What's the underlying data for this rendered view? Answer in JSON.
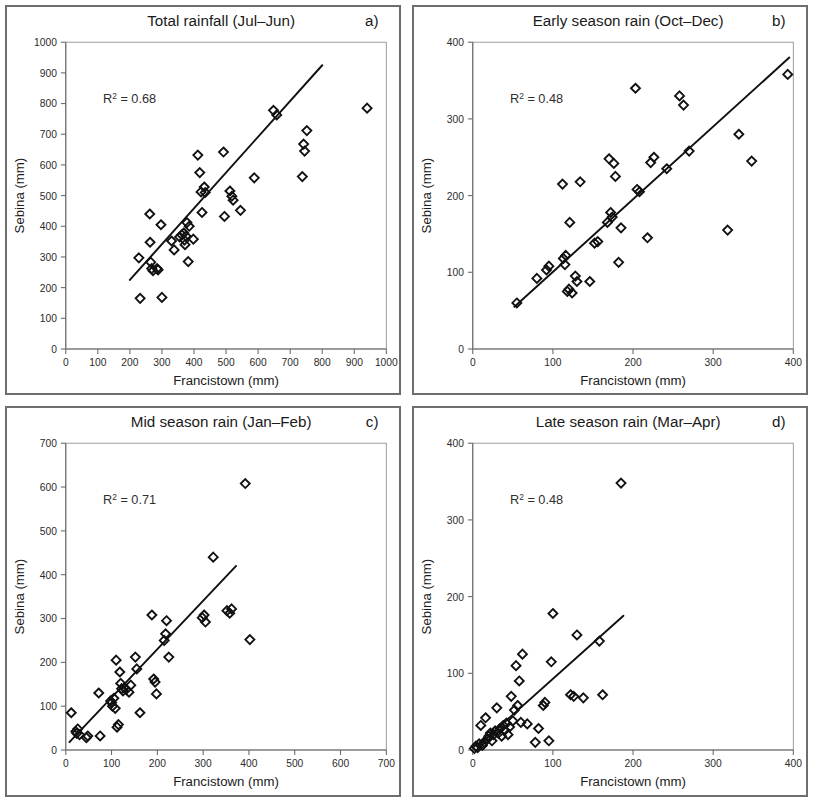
{
  "figure": {
    "axis_label_x": "Francistown (mm)",
    "axis_label_y": "Sebina (mm)",
    "marker_color": "#111111",
    "line_color": "#111111",
    "frame_color": "#6e6e6e"
  },
  "panels": [
    {
      "id": "panel-a",
      "letter": "a)",
      "title": "Total rainfall (Jul–Jun)",
      "r2_label": "R² = 0.68"
    },
    {
      "id": "panel-b",
      "letter": "b)",
      "title": "Early season rain (Oct–Dec)",
      "r2_label": "R² = 0.48"
    },
    {
      "id": "panel-c",
      "letter": "c)",
      "title": "Mid season rain (Jan–Feb)",
      "r2_label": "R² = 0.71"
    },
    {
      "id": "panel-d",
      "letter": "d)",
      "title": "Late season rain (Mar–Apr)",
      "r2_label": "R² = 0.48"
    }
  ],
  "chart_data": [
    {
      "type": "scatter",
      "panel": "a",
      "title": "Total rainfall (Jul–Jun)",
      "xlabel": "Francistown (mm)",
      "ylabel": "Sebina (mm)",
      "xlim": [
        0,
        1000
      ],
      "ylim": [
        0,
        1000
      ],
      "xticks": [
        0,
        100,
        200,
        300,
        400,
        500,
        600,
        700,
        800,
        900,
        1000
      ],
      "yticks": [
        0,
        100,
        200,
        300,
        400,
        500,
        600,
        700,
        800,
        900,
        1000
      ],
      "grid": false,
      "legend": "none",
      "annotation": "R² = 0.68",
      "r_squared": 0.68,
      "marker": "open-diamond",
      "trendline": {
        "x": [
          200,
          800
        ],
        "y": [
          225,
          925
        ]
      },
      "points": [
        [
          228,
          297
        ],
        [
          232,
          165
        ],
        [
          262,
          440
        ],
        [
          263,
          348
        ],
        [
          265,
          283
        ],
        [
          268,
          262
        ],
        [
          272,
          255
        ],
        [
          285,
          262
        ],
        [
          288,
          258
        ],
        [
          297,
          405
        ],
        [
          300,
          168
        ],
        [
          330,
          352
        ],
        [
          338,
          323
        ],
        [
          355,
          365
        ],
        [
          362,
          372
        ],
        [
          368,
          378
        ],
        [
          370,
          355
        ],
        [
          372,
          340
        ],
        [
          375,
          368
        ],
        [
          378,
          412
        ],
        [
          382,
          285
        ],
        [
          385,
          400
        ],
        [
          398,
          358
        ],
        [
          412,
          632
        ],
        [
          418,
          575
        ],
        [
          422,
          512
        ],
        [
          425,
          445
        ],
        [
          432,
          528
        ],
        [
          435,
          510
        ],
        [
          492,
          642
        ],
        [
          495,
          432
        ],
        [
          512,
          515
        ],
        [
          518,
          498
        ],
        [
          522,
          485
        ],
        [
          545,
          452
        ],
        [
          588,
          558
        ],
        [
          648,
          778
        ],
        [
          658,
          763
        ],
        [
          738,
          562
        ],
        [
          742,
          668
        ],
        [
          745,
          645
        ],
        [
          752,
          712
        ],
        [
          940,
          785
        ]
      ]
    },
    {
      "type": "scatter",
      "panel": "b",
      "title": "Early season rain (Oct–Dec)",
      "xlabel": "Francistown (mm)",
      "ylabel": "Sebina (mm)",
      "xlim": [
        0,
        400
      ],
      "ylim": [
        0,
        400
      ],
      "xticks": [
        0,
        100,
        200,
        300,
        400
      ],
      "yticks": [
        0,
        100,
        200,
        300,
        400
      ],
      "grid": false,
      "legend": "none",
      "annotation": "R² = 0.48",
      "r_squared": 0.48,
      "marker": "open-diamond",
      "trendline": {
        "x": [
          52,
          395
        ],
        "y": [
          55,
          380
        ]
      },
      "points": [
        [
          55,
          60
        ],
        [
          80,
          92
        ],
        [
          92,
          103
        ],
        [
          95,
          108
        ],
        [
          112,
          215
        ],
        [
          113,
          118
        ],
        [
          115,
          110
        ],
        [
          116,
          122
        ],
        [
          118,
          75
        ],
        [
          120,
          78
        ],
        [
          121,
          165
        ],
        [
          124,
          73
        ],
        [
          128,
          95
        ],
        [
          130,
          88
        ],
        [
          134,
          218
        ],
        [
          146,
          88
        ],
        [
          152,
          138
        ],
        [
          156,
          140
        ],
        [
          168,
          165
        ],
        [
          170,
          248
        ],
        [
          172,
          178
        ],
        [
          174,
          172
        ],
        [
          176,
          242
        ],
        [
          178,
          225
        ],
        [
          182,
          113
        ],
        [
          185,
          158
        ],
        [
          203,
          340
        ],
        [
          205,
          208
        ],
        [
          208,
          205
        ],
        [
          218,
          145
        ],
        [
          222,
          243
        ],
        [
          226,
          250
        ],
        [
          242,
          235
        ],
        [
          258,
          330
        ],
        [
          263,
          318
        ],
        [
          270,
          258
        ],
        [
          318,
          155
        ],
        [
          332,
          280
        ],
        [
          348,
          245
        ],
        [
          393,
          358
        ]
      ]
    },
    {
      "type": "scatter",
      "panel": "c",
      "title": "Mid season rain (Jan–Feb)",
      "xlabel": "Francistown (mm)",
      "ylabel": "Sebina (mm)",
      "xlim": [
        0,
        700
      ],
      "ylim": [
        0,
        700
      ],
      "xticks": [
        0,
        100,
        200,
        300,
        400,
        500,
        600,
        700
      ],
      "yticks": [
        0,
        100,
        200,
        300,
        400,
        500,
        600,
        700
      ],
      "grid": false,
      "legend": "none",
      "annotation": "R² = 0.71",
      "r_squared": 0.71,
      "marker": "open-diamond",
      "trendline": {
        "x": [
          8,
          372
        ],
        "y": [
          18,
          420
        ]
      },
      "points": [
        [
          12,
          85
        ],
        [
          22,
          42
        ],
        [
          24,
          38
        ],
        [
          26,
          48
        ],
        [
          30,
          35
        ],
        [
          45,
          28
        ],
        [
          48,
          32
        ],
        [
          72,
          130
        ],
        [
          75,
          32
        ],
        [
          98,
          112
        ],
        [
          100,
          108
        ],
        [
          102,
          100
        ],
        [
          105,
          118
        ],
        [
          108,
          95
        ],
        [
          110,
          205
        ],
        [
          112,
          52
        ],
        [
          115,
          58
        ],
        [
          118,
          178
        ],
        [
          120,
          152
        ],
        [
          122,
          140
        ],
        [
          125,
          135
        ],
        [
          128,
          142
        ],
        [
          132,
          138
        ],
        [
          138,
          132
        ],
        [
          142,
          148
        ],
        [
          152,
          212
        ],
        [
          155,
          185
        ],
        [
          162,
          85
        ],
        [
          188,
          308
        ],
        [
          192,
          162
        ],
        [
          195,
          155
        ],
        [
          198,
          128
        ],
        [
          215,
          250
        ],
        [
          218,
          265
        ],
        [
          220,
          295
        ],
        [
          225,
          212
        ],
        [
          298,
          302
        ],
        [
          302,
          308
        ],
        [
          305,
          292
        ],
        [
          322,
          440
        ],
        [
          352,
          318
        ],
        [
          358,
          312
        ],
        [
          362,
          322
        ],
        [
          392,
          608
        ],
        [
          402,
          252
        ]
      ]
    },
    {
      "type": "scatter",
      "panel": "d",
      "title": "Late season rain (Mar–Apr)",
      "xlabel": "Francistown (mm)",
      "ylabel": "Sebina (mm)",
      "xlim": [
        0,
        400
      ],
      "ylim": [
        0,
        400
      ],
      "xticks": [
        0,
        100,
        200,
        300,
        400
      ],
      "yticks": [
        0,
        100,
        200,
        300,
        400
      ],
      "grid": false,
      "legend": "none",
      "annotation": "R² = 0.48",
      "r_squared": 0.48,
      "marker": "open-diamond",
      "trendline": {
        "x": [
          6,
          188
        ],
        "y": [
          5,
          175
        ]
      },
      "points": [
        [
          2,
          2
        ],
        [
          4,
          5
        ],
        [
          6,
          3
        ],
        [
          8,
          8
        ],
        [
          10,
          32
        ],
        [
          12,
          6
        ],
        [
          14,
          10
        ],
        [
          16,
          42
        ],
        [
          18,
          14
        ],
        [
          20,
          18
        ],
        [
          22,
          22
        ],
        [
          24,
          12
        ],
        [
          26,
          20
        ],
        [
          28,
          25
        ],
        [
          30,
          55
        ],
        [
          32,
          22
        ],
        [
          34,
          28
        ],
        [
          36,
          18
        ],
        [
          38,
          32
        ],
        [
          40,
          26
        ],
        [
          42,
          35
        ],
        [
          44,
          20
        ],
        [
          46,
          30
        ],
        [
          48,
          70
        ],
        [
          50,
          38
        ],
        [
          52,
          52
        ],
        [
          54,
          110
        ],
        [
          56,
          58
        ],
        [
          58,
          90
        ],
        [
          60,
          36
        ],
        [
          62,
          125
        ],
        [
          68,
          34
        ],
        [
          78,
          10
        ],
        [
          82,
          28
        ],
        [
          88,
          58
        ],
        [
          90,
          62
        ],
        [
          95,
          12
        ],
        [
          98,
          115
        ],
        [
          100,
          178
        ],
        [
          122,
          72
        ],
        [
          126,
          70
        ],
        [
          130,
          150
        ],
        [
          138,
          68
        ],
        [
          158,
          142
        ],
        [
          162,
          72
        ],
        [
          185,
          348
        ]
      ]
    }
  ]
}
